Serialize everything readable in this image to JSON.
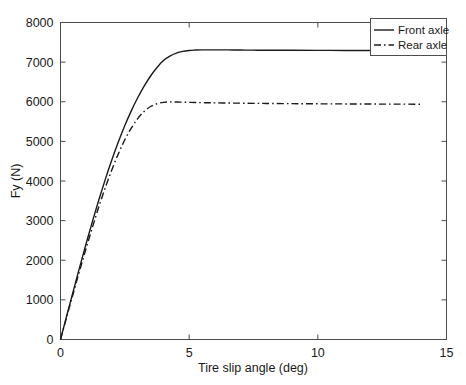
{
  "chart_data": {
    "type": "line",
    "title": "",
    "xlabel": "Tire slip angle (deg)",
    "ylabel": "Fy (N)",
    "xlim": [
      0,
      15
    ],
    "ylim": [
      0,
      8000
    ],
    "xticks": [
      0,
      5,
      10,
      15
    ],
    "yticks": [
      0,
      1000,
      2000,
      3000,
      4000,
      5000,
      6000,
      7000,
      8000
    ],
    "xtick_labels": [
      "0",
      "5",
      "10",
      "15"
    ],
    "ytick_labels": [
      "0",
      "1000",
      "2000",
      "3000",
      "4000",
      "5000",
      "6000",
      "7000",
      "8000"
    ],
    "grid": false,
    "legend_position": "upper right",
    "series": [
      {
        "name": "Front axle",
        "style": "solid",
        "color": "#1a1a1a",
        "saturation_value": 7300,
        "x": [
          0,
          0.25,
          0.5,
          0.75,
          1,
          1.25,
          1.5,
          1.75,
          2,
          2.25,
          2.5,
          2.75,
          3,
          3.25,
          3.5,
          3.75,
          4,
          4.25,
          4.5,
          4.75,
          5,
          5.25,
          5.5,
          5.75,
          6,
          6.5,
          7,
          7.5,
          8,
          9,
          10,
          11,
          12,
          13,
          14
        ],
        "y": [
          0,
          620,
          1235,
          1840,
          2430,
          3000,
          3545,
          4060,
          4545,
          4990,
          5400,
          5770,
          6100,
          6395,
          6650,
          6865,
          7040,
          7150,
          7225,
          7270,
          7295,
          7305,
          7310,
          7310,
          7310,
          7308,
          7305,
          7302,
          7300,
          7298,
          7296,
          7295,
          7293,
          7292,
          7290
        ]
      },
      {
        "name": "Rear axle",
        "style": "dashdot",
        "color": "#1a1a1a",
        "saturation_value": 5970,
        "x": [
          0,
          0.25,
          0.5,
          0.75,
          1,
          1.25,
          1.5,
          1.75,
          2,
          2.25,
          2.5,
          2.75,
          3,
          3.25,
          3.5,
          3.75,
          4,
          4.25,
          4.5,
          4.75,
          5,
          5.25,
          5.5,
          5.75,
          6,
          6.5,
          7,
          7.5,
          8,
          9,
          10,
          11,
          12,
          13,
          14
        ],
        "y": [
          0,
          590,
          1175,
          1750,
          2310,
          2850,
          3370,
          3850,
          4290,
          4690,
          5040,
          5335,
          5575,
          5755,
          5880,
          5950,
          5985,
          5995,
          5995,
          5990,
          5985,
          5980,
          5978,
          5975,
          5972,
          5968,
          5964,
          5960,
          5957,
          5952,
          5948,
          5945,
          5942,
          5940,
          5938
        ]
      }
    ],
    "legend_entries": [
      "Front axle",
      "Rear axle"
    ]
  },
  "axes": {
    "xlabel": "Tire slip angle (deg)",
    "ylabel": "Fy (N)"
  }
}
